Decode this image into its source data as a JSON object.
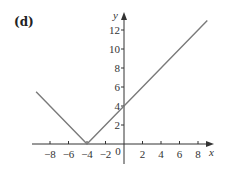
{
  "panel_label": "(d)",
  "chart_data": {
    "type": "line",
    "title": "",
    "panel": "(d)",
    "function": "y = |x + 4|",
    "xlabel": "x",
    "ylabel": "y",
    "xlim": [
      -10,
      9.5
    ],
    "ylim": [
      -2,
      14
    ],
    "x_ticks": [
      -8,
      -6,
      -4,
      -2,
      0,
      2,
      4,
      6,
      8
    ],
    "x_tick_labels": [
      "−8",
      "−6",
      "−4",
      "−2",
      "0",
      "2",
      "4",
      "6",
      "8"
    ],
    "y_ticks": [
      2,
      4,
      6,
      8,
      10,
      12
    ],
    "y_tick_labels": [
      "2",
      "4",
      "6",
      "8",
      "10",
      "12"
    ],
    "grid": false,
    "legend": null,
    "series": [
      {
        "name": "y = |x + 4|",
        "x": [
          -9.5,
          -4,
          9
        ],
        "y": [
          5.5,
          0,
          13
        ],
        "color": "#7a7a7a"
      }
    ],
    "colors": {
      "axis": "#333333",
      "line": "#7a7a7a",
      "background": "#ffffff"
    }
  }
}
